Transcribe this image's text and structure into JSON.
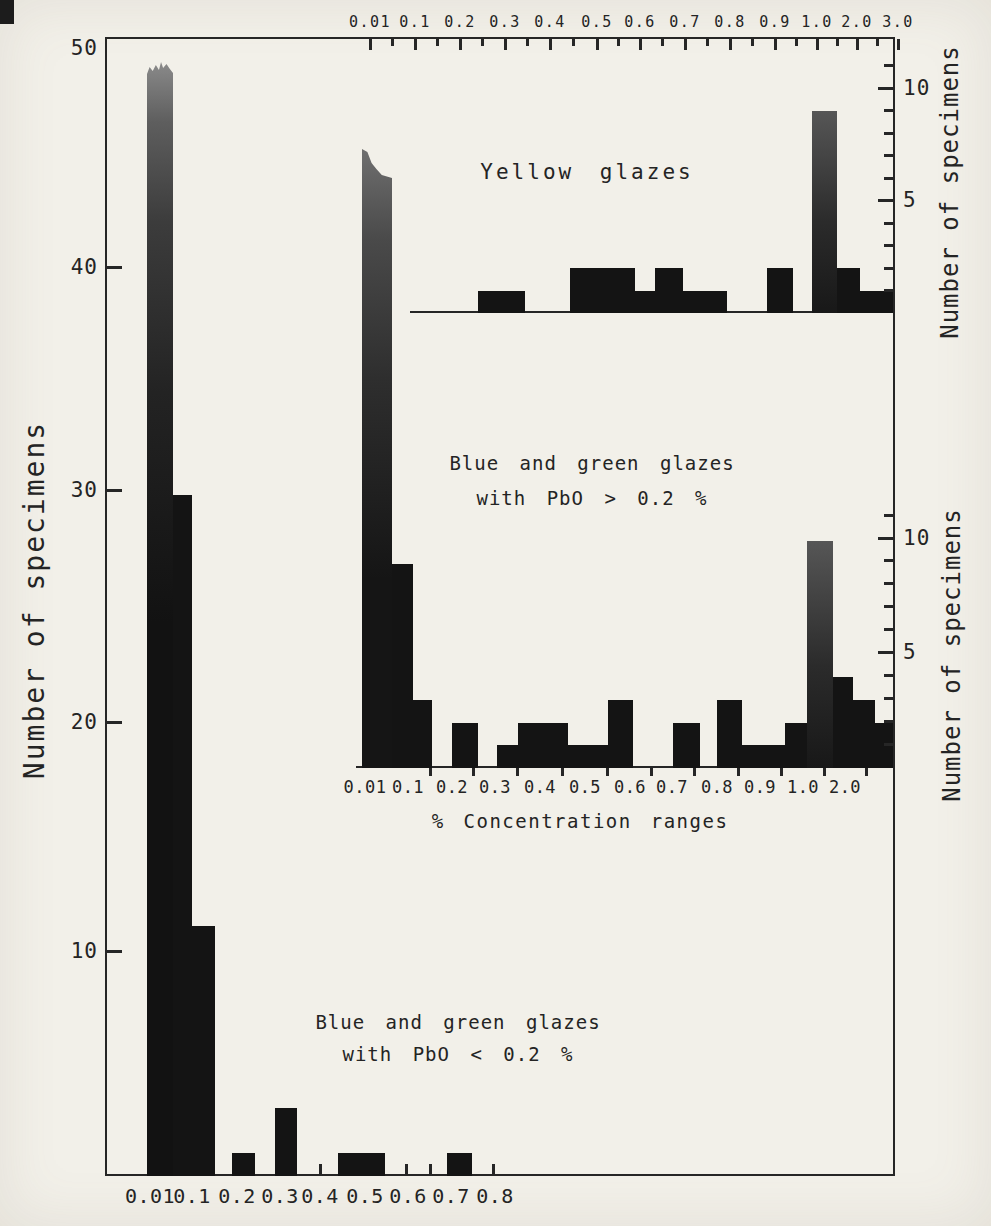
{
  "page": {
    "width": 991,
    "height": 1226,
    "background": "#f2f0e9",
    "ink": "#262626",
    "bar_color": "#141414"
  },
  "labels": {
    "left_axis_title": "Number of specimens",
    "right_axis_title_top": "Number of specimens",
    "right_axis_title_middle": "Number of specimens",
    "middle_xaxis_title": "% Concentration ranges",
    "yellow_title": "Yellow glazes",
    "middle_title_line1": "Blue and green glazes",
    "middle_title_line2": "with  PbO >  0.2 %",
    "main_title_line1": "Blue and green glazes",
    "main_title_line2": "with  PbO <  0.2 %"
  },
  "chart_data": [
    {
      "id": "main",
      "type": "bar",
      "title": "Blue and green glazes with PbO < 0.2 %",
      "ylabel": "Number of specimens",
      "xlabel": "% Concentration ranges",
      "ylim": [
        0,
        50
      ],
      "yticks": [
        50,
        40,
        30,
        20,
        10
      ],
      "xticklabels": [
        "0.01",
        "0.1",
        "0.2",
        "0.3",
        "0.4",
        "0.5",
        "0.6",
        "0.7",
        "0.8"
      ],
      "grid": false,
      "baseline": 1176,
      "unit": 22.7,
      "bins": [
        {
          "range": "0.01-0.05",
          "value": 49,
          "truncated": true,
          "px": {
            "x": 147,
            "w": 26,
            "top": 62,
            "grad": "g1",
            "clip": "jag"
          }
        },
        {
          "range": "0.05-0.1",
          "value": 30,
          "px": {
            "x": 173,
            "w": 19
          }
        },
        {
          "range": "0.1-0.15",
          "value": 11,
          "px": {
            "x": 192,
            "w": 23
          }
        },
        {
          "range": "0.2-0.25",
          "value": 1,
          "px": {
            "x": 232,
            "w": 23
          }
        },
        {
          "range": "0.3-0.35",
          "value": 3,
          "px": {
            "x": 275,
            "w": 22
          }
        },
        {
          "range": "0.45-0.55",
          "value": 1,
          "px": {
            "x": 338,
            "w": 47
          }
        },
        {
          "range": "0.7-0.75",
          "value": 1,
          "px": {
            "x": 447,
            "w": 25
          }
        }
      ]
    },
    {
      "id": "yellow",
      "type": "bar",
      "title": "Yellow glazes",
      "ylabel": "Number of specimens",
      "ylim": [
        0,
        11
      ],
      "yticks": [
        10,
        5
      ],
      "grid": false,
      "baseline": 313,
      "unit": 22.4,
      "baseline_line": {
        "x1": 410,
        "x2": 893
      },
      "bins": [
        {
          "range": "0.01-0.05",
          "value": 7,
          "truncated": true,
          "note": "drawn merged with 0.01 column of PbO>0.2% panel",
          "px": null
        },
        {
          "range": "0.25-0.35",
          "value": 1,
          "px": {
            "x": 478,
            "w": 47
          }
        },
        {
          "range": "0.45-0.6",
          "value": 2,
          "px": {
            "x": 570,
            "w": 65
          }
        },
        {
          "range": "0.6-0.65",
          "value": 1,
          "px": {
            "x": 635,
            "w": 20
          }
        },
        {
          "range": "0.65-0.7",
          "value": 2,
          "px": {
            "x": 655,
            "w": 28
          }
        },
        {
          "range": "0.7-0.8",
          "value": 1,
          "px": {
            "x": 683,
            "w": 44
          }
        },
        {
          "range": "0.9-0.95",
          "value": 2,
          "px": {
            "x": 767,
            "w": 26
          }
        },
        {
          "range": "1.0-1.5",
          "value": 9,
          "px": {
            "x": 812,
            "w": 25,
            "grad": "g3"
          }
        },
        {
          "range": "1.5-2.0",
          "value": 2,
          "px": {
            "x": 837,
            "w": 23
          }
        },
        {
          "range": "2.0-3.0",
          "value": 1,
          "px": {
            "x": 860,
            "w": 33
          }
        }
      ]
    },
    {
      "id": "blue-green-high",
      "type": "bar",
      "title": "Blue and green glazes with PbO > 0.2 %",
      "ylabel": "Number of specimens",
      "xlabel": "% Concentration ranges",
      "ylim": [
        0,
        11
      ],
      "yticks": [
        10,
        5
      ],
      "xticklabels": [
        "0.01",
        "0.1",
        "0.2",
        "0.3",
        "0.4",
        "0.5",
        "0.6",
        "0.7",
        "0.8",
        "0.9",
        "1.0",
        "2.0"
      ],
      "grid": false,
      "baseline": 768,
      "unit": 22.7,
      "baseline_line": {
        "x1": 356,
        "x2": 893
      },
      "bins": [
        {
          "range": "0.01-0.05",
          "value": 27,
          "truncated": true,
          "px": {
            "x": 362,
            "w": 30,
            "top": 149,
            "grad": "g2",
            "clip": "slope"
          }
        },
        {
          "range": "0.05-0.1",
          "value": 9,
          "px": {
            "x": 392,
            "w": 21
          }
        },
        {
          "range": "0.1-0.15",
          "value": 3,
          "px": {
            "x": 413,
            "w": 19
          }
        },
        {
          "range": "0.2-0.25",
          "value": 2,
          "px": {
            "x": 452,
            "w": 26
          }
        },
        {
          "range": "0.3-0.35",
          "value": 1,
          "px": {
            "x": 497,
            "w": 21
          }
        },
        {
          "range": "0.35-0.45",
          "value": 2,
          "px": {
            "x": 518,
            "w": 50
          }
        },
        {
          "range": "0.45-0.55",
          "value": 1,
          "px": {
            "x": 568,
            "w": 40
          }
        },
        {
          "range": "0.55-0.6",
          "value": 3,
          "px": {
            "x": 608,
            "w": 25
          }
        },
        {
          "range": "0.7-0.75",
          "value": 2,
          "px": {
            "x": 673,
            "w": 27
          }
        },
        {
          "range": "0.8-0.85",
          "value": 3,
          "px": {
            "x": 717,
            "w": 25
          }
        },
        {
          "range": "0.85-0.95",
          "value": 1,
          "px": {
            "x": 742,
            "w": 43
          }
        },
        {
          "range": "0.95-1.0",
          "value": 2,
          "px": {
            "x": 785,
            "w": 22
          }
        },
        {
          "range": "1.0-1.5",
          "value": 10,
          "px": {
            "x": 807,
            "w": 26,
            "grad": "g3"
          }
        },
        {
          "range": "1.5-2.0",
          "value": 4,
          "px": {
            "x": 833,
            "w": 20
          }
        },
        {
          "range": "2.0-2.5",
          "value": 3,
          "px": {
            "x": 853,
            "w": 22
          }
        },
        {
          "range": "2.5-3.0",
          "value": 2,
          "px": {
            "x": 875,
            "w": 18
          }
        }
      ]
    }
  ],
  "render": {
    "frame": {
      "x": 105,
      "y": 37,
      "w": 790,
      "h": 1139
    },
    "axes": {
      "top": {
        "y": 39,
        "label_y": 22,
        "major_len": 11,
        "minor_len": 7,
        "font": 15,
        "labels": [
          [
            "0.01",
            370
          ],
          [
            "0.1",
            415
          ],
          [
            "0.2",
            460
          ],
          [
            "0.3",
            505
          ],
          [
            "0.4",
            550
          ],
          [
            "0.5",
            597
          ],
          [
            "0.6",
            640
          ],
          [
            "0.7",
            685
          ],
          [
            "0.8",
            730
          ],
          [
            "0.9",
            775
          ],
          [
            "1.0",
            817
          ],
          [
            "2.0",
            857
          ],
          [
            "3.0",
            898
          ]
        ],
        "minors": [
          392,
          437,
          482,
          527,
          573,
          618,
          662,
          707,
          752,
          796,
          837,
          877
        ]
      },
      "left": {
        "x": 107,
        "len": 15,
        "label_x": 98,
        "font": 21,
        "labels": [
          [
            "50",
            48,
            false
          ],
          [
            "40",
            267,
            true
          ],
          [
            "30",
            490,
            true
          ],
          [
            "20",
            722,
            true
          ],
          [
            "10",
            951,
            true
          ]
        ]
      },
      "right_top": {
        "x": 893,
        "label_x": 903,
        "long_len": 15,
        "short_len": 9,
        "font": 21,
        "labeled": [
          [
            "10",
            88
          ],
          [
            "5",
            200
          ]
        ],
        "units": [
          65,
          110,
          133,
          155,
          178,
          223,
          245,
          268,
          290
        ]
      },
      "right_mid": {
        "x": 893,
        "label_x": 903,
        "long_len": 15,
        "short_len": 9,
        "font": 21,
        "labeled": [
          [
            "10",
            538
          ],
          [
            "5",
            652
          ]
        ],
        "units": [
          515,
          560,
          583,
          606,
          629,
          675,
          698,
          721,
          744
        ]
      },
      "bottom_main": {
        "y": 1174,
        "tick_len": 10,
        "label_y": 1196,
        "font": 20,
        "labels": [
          [
            "0.01",
            150
          ],
          [
            "0.1",
            192
          ],
          [
            "0.2",
            237
          ],
          [
            "0.3",
            280
          ],
          [
            "0.4",
            320
          ],
          [
            "0.5",
            365
          ],
          [
            "0.6",
            408
          ],
          [
            "0.7",
            451
          ],
          [
            "0.8",
            495
          ]
        ],
        "ticks": [
          320,
          406,
          430,
          493
        ]
      },
      "bottom_mid": {
        "y": 768,
        "tick_len": 8,
        "label_y": 787,
        "font": 17,
        "labels": [
          [
            "0.01",
            365
          ],
          [
            "0.1",
            408
          ],
          [
            "0.2",
            452
          ],
          [
            "0.3",
            495
          ],
          [
            "0.4",
            540
          ],
          [
            "0.5",
            585
          ],
          [
            "0.6",
            630
          ],
          [
            "0.7",
            672
          ],
          [
            "0.8",
            717
          ],
          [
            "0.9",
            760
          ],
          [
            "1.0",
            803
          ],
          [
            "2.0",
            845
          ]
        ],
        "ticks": [
          430,
          473,
          517,
          562,
          607,
          651,
          694,
          738,
          781,
          824,
          866
        ]
      }
    },
    "texts": {
      "yellow_title": {
        "x": 587,
        "y": 172,
        "font": 21,
        "ls": 3,
        "ws": 10
      },
      "middle_title": {
        "x": 592,
        "y1": 463,
        "y2": 498,
        "font": 19,
        "ls": 1,
        "ws": 8
      },
      "main_title": {
        "x": 458,
        "y1": 1022,
        "y2": 1054,
        "font": 19,
        "ls": 1,
        "ws": 8
      },
      "mid_xaxis": {
        "x": 580,
        "y": 821,
        "font": 19,
        "ls": 1.5,
        "ws": 6
      },
      "left_rot": {
        "x": 34,
        "y": 600,
        "font": 28,
        "ls": 2
      },
      "right_rot_top": {
        "x": 950,
        "y": 192,
        "font": 24,
        "ls": 1
      },
      "right_rot_mid": {
        "x": 952,
        "y": 655,
        "font": 24,
        "ls": 1
      }
    }
  }
}
